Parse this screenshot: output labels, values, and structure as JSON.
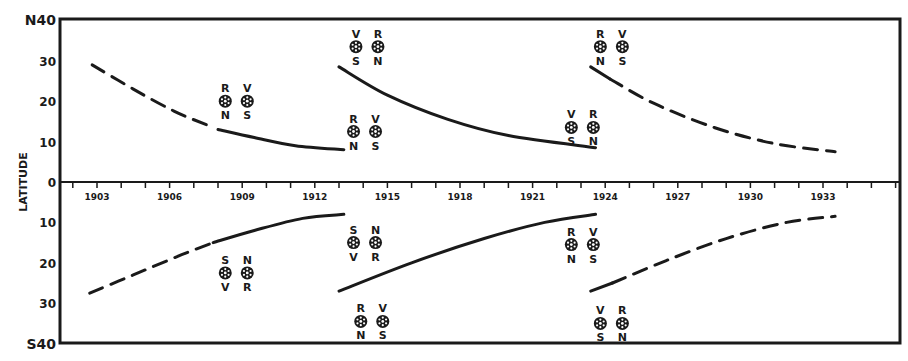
{
  "chart_data": {
    "type": "line",
    "title": "",
    "xlabel": "",
    "ylabel": "LATITUDE",
    "x_range": [
      1900.5,
      1937.2
    ],
    "y_range": [
      -40,
      40
    ],
    "y_ticks": [
      {
        "value": 40,
        "label": "N40"
      },
      {
        "value": 30,
        "label": "30"
      },
      {
        "value": 20,
        "label": "20"
      },
      {
        "value": 10,
        "label": "10"
      },
      {
        "value": 0,
        "label": "0"
      },
      {
        "value": -10,
        "label": "10"
      },
      {
        "value": -20,
        "label": "20"
      },
      {
        "value": -30,
        "label": "30"
      },
      {
        "value": -40,
        "label": "S40"
      }
    ],
    "x_tick_labels": [
      "1903",
      "1906",
      "1909",
      "1912",
      "1915",
      "1918",
      "1921",
      "1924",
      "1927",
      "1930",
      "1933"
    ],
    "x_minor_ticks_every_year": true,
    "grid": false,
    "legend": null,
    "series": [
      {
        "name": "north-cycle-1-dashed",
        "hemisphere": "N",
        "style": "dashed",
        "points": [
          [
            1902.8,
            29
          ],
          [
            1904.5,
            23
          ],
          [
            1906.2,
            17.5
          ],
          [
            1907.6,
            14
          ]
        ]
      },
      {
        "name": "north-cycle-1-solid",
        "hemisphere": "N",
        "style": "solid",
        "points": [
          [
            1908.0,
            13
          ],
          [
            1909.5,
            11
          ],
          [
            1911.2,
            9
          ],
          [
            1913.2,
            8
          ]
        ]
      },
      {
        "name": "north-cycle-2-solid",
        "hemisphere": "N",
        "style": "solid",
        "points": [
          [
            1913.0,
            28.5
          ],
          [
            1915.0,
            21.5
          ],
          [
            1917.5,
            15.5
          ],
          [
            1920.0,
            11.5
          ],
          [
            1923.6,
            8.5
          ]
        ]
      },
      {
        "name": "north-cycle-3-solid",
        "hemisphere": "N",
        "style": "solid",
        "points": [
          [
            1923.4,
            28.5
          ],
          [
            1924.2,
            25.5
          ]
        ]
      },
      {
        "name": "north-cycle-3-dashed",
        "hemisphere": "N",
        "style": "dashed",
        "points": [
          [
            1924.2,
            25.5
          ],
          [
            1926.0,
            19.5
          ],
          [
            1928.5,
            13.5
          ],
          [
            1931.0,
            9.5
          ],
          [
            1933.5,
            7.5
          ]
        ]
      },
      {
        "name": "south-cycle-1-dashed",
        "hemisphere": "S",
        "style": "dashed",
        "points": [
          [
            1902.7,
            -27.5
          ],
          [
            1904.5,
            -23
          ],
          [
            1906.5,
            -18
          ],
          [
            1907.8,
            -15
          ]
        ]
      },
      {
        "name": "south-cycle-1-solid",
        "hemisphere": "S",
        "style": "solid",
        "points": [
          [
            1907.8,
            -15
          ],
          [
            1909.5,
            -12
          ],
          [
            1911.5,
            -9
          ],
          [
            1913.2,
            -8
          ]
        ]
      },
      {
        "name": "south-cycle-2-solid",
        "hemisphere": "S",
        "style": "solid",
        "points": [
          [
            1913.0,
            -27
          ],
          [
            1916.0,
            -20
          ],
          [
            1919.0,
            -14
          ],
          [
            1921.5,
            -10
          ],
          [
            1923.6,
            -8
          ]
        ]
      },
      {
        "name": "south-cycle-3-solid",
        "hemisphere": "S",
        "style": "solid",
        "points": [
          [
            1923.4,
            -27
          ],
          [
            1924.3,
            -25
          ]
        ]
      },
      {
        "name": "south-cycle-3-dashed",
        "hemisphere": "S",
        "style": "dashed",
        "points": [
          [
            1924.3,
            -25
          ],
          [
            1926.5,
            -19.5
          ],
          [
            1929.0,
            -14
          ],
          [
            1931.5,
            -10
          ],
          [
            1933.5,
            -8.5
          ]
        ]
      }
    ],
    "annotations": [
      {
        "x": 1908.3,
        "y": 20,
        "pair": [
          {
            "top": "R",
            "bottom": "N"
          },
          {
            "top": "V",
            "bottom": "S"
          }
        ]
      },
      {
        "x": 1913.6,
        "y": 12.5,
        "pair": [
          {
            "top": "R",
            "bottom": "N"
          },
          {
            "top": "V",
            "bottom": "S"
          }
        ]
      },
      {
        "x": 1913.7,
        "y": 33.5,
        "pair": [
          {
            "top": "V",
            "bottom": "S"
          },
          {
            "top": "R",
            "bottom": "N"
          }
        ]
      },
      {
        "x": 1922.6,
        "y": 13.5,
        "pair": [
          {
            "top": "V",
            "bottom": "S"
          },
          {
            "top": "R",
            "bottom": "N"
          }
        ]
      },
      {
        "x": 1923.8,
        "y": 33.5,
        "pair": [
          {
            "top": "R",
            "bottom": "N"
          },
          {
            "top": "V",
            "bottom": "S"
          }
        ]
      },
      {
        "x": 1908.3,
        "y": -22.5,
        "pair": [
          {
            "top": "S",
            "bottom": "V"
          },
          {
            "top": "N",
            "bottom": "R"
          }
        ]
      },
      {
        "x": 1913.6,
        "y": -15,
        "pair": [
          {
            "top": "S",
            "bottom": "V"
          },
          {
            "top": "N",
            "bottom": "R"
          }
        ]
      },
      {
        "x": 1913.9,
        "y": -34.5,
        "pair": [
          {
            "top": "R",
            "bottom": "N"
          },
          {
            "top": "V",
            "bottom": "S"
          }
        ]
      },
      {
        "x": 1922.6,
        "y": -15.5,
        "pair": [
          {
            "top": "R",
            "bottom": "N"
          },
          {
            "top": "V",
            "bottom": "S"
          }
        ]
      },
      {
        "x": 1923.8,
        "y": -35,
        "pair": [
          {
            "top": "V",
            "bottom": "S"
          },
          {
            "top": "R",
            "bottom": "N"
          }
        ]
      }
    ]
  },
  "style": {
    "ink": "#1a1a1a",
    "paper": "#ffffff"
  }
}
